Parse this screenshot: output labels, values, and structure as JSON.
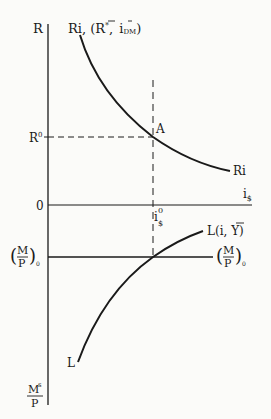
{
  "diagram": {
    "type": "economics-two-panel",
    "colors": {
      "ink": "#1a1a1a",
      "background": "#fbfbf9"
    },
    "labels": {
      "y_axis_top": "R",
      "ri_curve_head": "Ri, (",
      "ri_curve_rbar": "R",
      "ri_curve_rstar": "*",
      "ri_curve_comma": ",",
      "ri_curve_ibar": "i",
      "ri_curve_dm": "DM",
      "ri_curve_close": ")",
      "r_zero": "R",
      "r_zero_sup": "0",
      "point_a": "A",
      "ri_curve_tail": "Ri",
      "x_axis": "i",
      "x_axis_sub": "$",
      "origin": "0",
      "i_zero": "i",
      "i_zero_sup": "0",
      "i_zero_sub": "$",
      "l_curve_head": "L(i, ",
      "l_curve_y": "Y",
      "l_curve_close": ")",
      "mp_num": "M",
      "mp_den": "P",
      "mp_sub": "0",
      "l_curve_tail": "L",
      "ms_num": "M",
      "ms_sup": "s",
      "ms_den": "P"
    },
    "geometry": {
      "axis_x": 48,
      "axis_top": 24,
      "axis_bottom": 405,
      "zero_line_y": 205,
      "r0_y": 137,
      "i0_x": 153,
      "mp_line_y": 257
    }
  }
}
